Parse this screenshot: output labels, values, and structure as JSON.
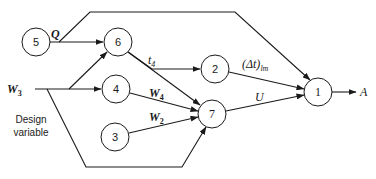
{
  "diagram": {
    "nodes": [
      {
        "id": "5",
        "label": "5"
      },
      {
        "id": "6",
        "label": "6"
      },
      {
        "id": "4",
        "label": "4"
      },
      {
        "id": "3",
        "label": "3"
      },
      {
        "id": "2",
        "label": "2"
      },
      {
        "id": "7",
        "label": "7"
      },
      {
        "id": "1",
        "label": "1"
      }
    ],
    "edges": [
      {
        "from": "5",
        "to": "6",
        "label": "Q"
      },
      {
        "from": "5",
        "to": "1",
        "label": "Q"
      },
      {
        "from": "W3",
        "to": "6",
        "label": ""
      },
      {
        "from": "W3",
        "to": "4",
        "label": ""
      },
      {
        "from": "W3",
        "to": "7",
        "label": ""
      },
      {
        "from": "6",
        "to": "2",
        "label": "t4"
      },
      {
        "from": "6",
        "to": "7",
        "label": ""
      },
      {
        "from": "4",
        "to": "7",
        "label": "W4"
      },
      {
        "from": "3",
        "to": "7",
        "label": "W2"
      },
      {
        "from": "2",
        "to": "1",
        "label": "(Δt)lm"
      },
      {
        "from": "7",
        "to": "1",
        "label": "U"
      },
      {
        "from": "1",
        "to": "A",
        "label": ""
      }
    ],
    "labels": {
      "Q": "Q",
      "t4_main": "t",
      "t4_sub": "4",
      "w3_main": "W",
      "w3_sub": "3",
      "w4_main": "W",
      "w4_sub": "4",
      "w2_main": "W",
      "w2_sub": "2",
      "dt_main": "(Δt)",
      "dt_sub": "lm",
      "U": "U",
      "A": "A"
    },
    "note_line1": "Design",
    "note_line2": "variable"
  }
}
